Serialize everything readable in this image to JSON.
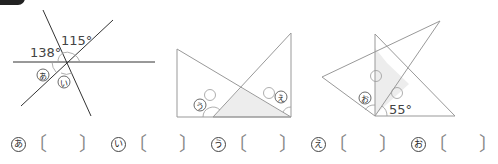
{
  "figures": [
    {
      "id": "fig1",
      "angles": {
        "a": "138°",
        "b": "115°"
      },
      "unknowns": [
        "あ",
        "い"
      ]
    },
    {
      "id": "fig2",
      "unknowns": [
        "う",
        "え"
      ]
    },
    {
      "id": "fig3",
      "angles": {
        "a": "55°"
      },
      "unknowns": [
        "お"
      ]
    }
  ],
  "answers": [
    {
      "label": "あ",
      "open": "〔",
      "close": "〕"
    },
    {
      "label": "い",
      "open": "〔",
      "close": "〕"
    },
    {
      "label": "う",
      "open": "〔",
      "close": "〕"
    },
    {
      "label": "え",
      "open": "〔",
      "close": "〕"
    },
    {
      "label": "お",
      "open": "〔",
      "close": "〕"
    }
  ],
  "colors": {
    "line": "#333333",
    "tri_line": "#999999",
    "shade": "#ededed"
  }
}
